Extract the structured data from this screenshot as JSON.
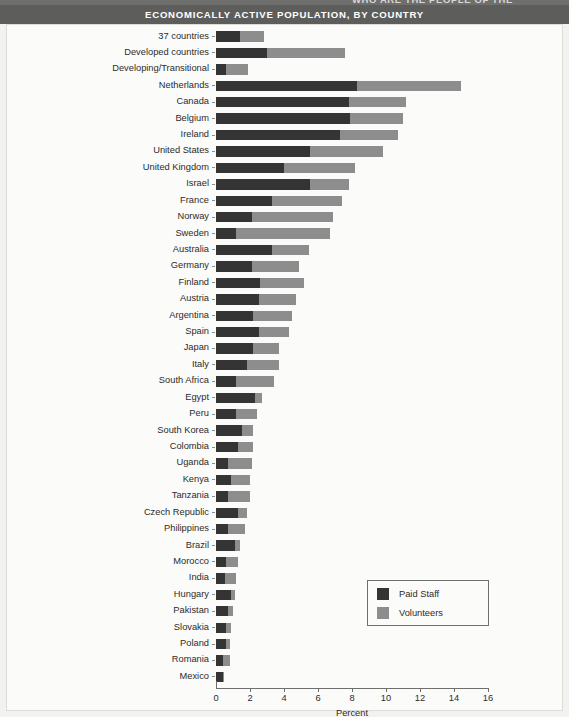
{
  "page": {
    "running_head": "WHO ARE THE PEOPLE OF THE",
    "title": "ECONOMICALLY ACTIVE POPULATION, BY COUNTRY"
  },
  "legend": {
    "items": [
      {
        "label": "Paid Staff",
        "color": "#343434",
        "key": "paid"
      },
      {
        "label": "Volunteers",
        "color": "#8d8d8d",
        "key": "volunteers"
      }
    ]
  },
  "chart_data": {
    "type": "bar",
    "orientation": "horizontal",
    "stacked": true,
    "title": "ECONOMICALLY ACTIVE POPULATION, BY COUNTRY",
    "xlabel": "Percent",
    "ylabel": "",
    "xlim": [
      0,
      16
    ],
    "xticks": [
      0,
      2,
      4,
      6,
      8,
      10,
      12,
      14,
      16
    ],
    "xtick_labels": [
      "0",
      "2",
      "4",
      "6",
      "8",
      "10",
      "12",
      "14",
      "16"
    ],
    "grid": false,
    "legend_position": "lower right",
    "categories": [
      "37 countries",
      "Developed countries",
      "Developing/Transitional",
      "Netherlands",
      "Canada",
      "Belgium",
      "Ireland",
      "United States",
      "United Kingdom",
      "Israel",
      "France",
      "Norway",
      "Sweden",
      "Australia",
      "Germany",
      "Finland",
      "Austria",
      "Argentina",
      "Spain",
      "Japan",
      "Italy",
      "South Africa",
      "Egypt",
      "Peru",
      "South Korea",
      "Colombia",
      "Uganda",
      "Kenya",
      "Tanzania",
      "Czech Republic",
      "Philippines",
      "Brazil",
      "Morocco",
      "India",
      "Hungary",
      "Pakistan",
      "Slovakia",
      "Poland",
      "Romania",
      "Mexico"
    ],
    "series": [
      {
        "name": "Paid Staff",
        "color": "#343434",
        "values": [
          1.4,
          3.0,
          0.6,
          8.3,
          7.8,
          7.9,
          7.3,
          5.5,
          4.0,
          5.5,
          3.3,
          2.1,
          1.2,
          3.3,
          2.1,
          2.6,
          2.5,
          2.2,
          2.5,
          2.2,
          1.8,
          1.2,
          2.3,
          1.2,
          1.5,
          1.3,
          0.7,
          0.9,
          0.7,
          1.3,
          0.7,
          1.1,
          0.6,
          0.5,
          0.9,
          0.7,
          0.6,
          0.6,
          0.4,
          0.4
        ]
      },
      {
        "name": "Volunteers",
        "color": "#8d8d8d",
        "values": [
          1.4,
          4.6,
          1.3,
          6.1,
          3.4,
          3.1,
          3.4,
          4.3,
          4.2,
          2.3,
          4.1,
          4.8,
          5.5,
          2.2,
          2.8,
          2.6,
          2.2,
          2.3,
          1.8,
          1.5,
          1.9,
          2.2,
          0.4,
          1.2,
          0.7,
          0.9,
          1.4,
          1.1,
          1.3,
          0.5,
          1.0,
          0.3,
          0.7,
          0.7,
          0.2,
          0.3,
          0.3,
          0.2,
          0.4,
          0.1
        ]
      }
    ],
    "totals": [
      2.8,
      7.6,
      1.9,
      14.4,
      11.2,
      11.0,
      10.7,
      9.8,
      8.2,
      7.8,
      7.4,
      6.9,
      6.7,
      5.5,
      4.9,
      5.2,
      4.7,
      4.5,
      4.3,
      3.7,
      3.7,
      3.4,
      2.7,
      2.4,
      2.2,
      2.2,
      2.1,
      2.0,
      2.0,
      1.8,
      1.7,
      1.4,
      1.3,
      1.2,
      1.1,
      1.0,
      0.9,
      0.8,
      0.8,
      0.5
    ]
  }
}
